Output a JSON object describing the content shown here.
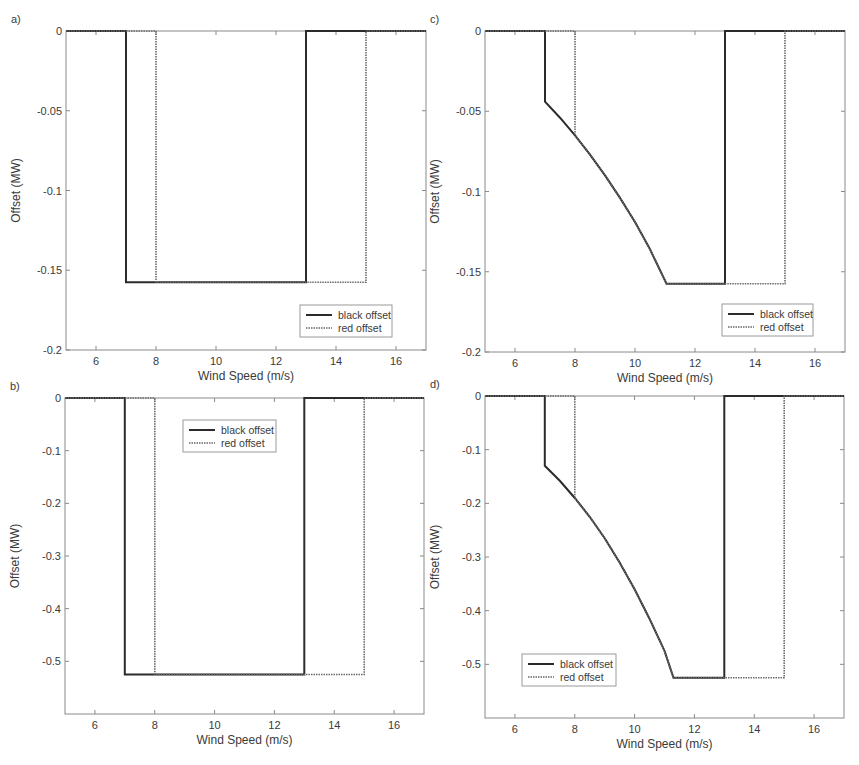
{
  "figure": {
    "colors": {
      "black_offset": "#2b2b2b",
      "red_offset": "#6a6a6a",
      "axis": "#8a8a8a",
      "legend_border": "#9a9a9a",
      "background": "#ffffff"
    }
  },
  "chart_data": [
    {
      "id": "a",
      "panel_label": "a)",
      "type": "line",
      "title": "",
      "xlabel": "Wind Speed (m/s)",
      "ylabel": "Offset (MW)",
      "xlim": [
        5,
        17
      ],
      "ylim": [
        -0.2,
        0
      ],
      "xticks": [
        6,
        8,
        10,
        12,
        14,
        16
      ],
      "yticks": [
        0,
        -0.05,
        -0.1,
        -0.15,
        -0.2
      ],
      "ytick_labels": [
        "0",
        "-0.05",
        "-0.1",
        "-0.15",
        "-0.2"
      ],
      "grid": false,
      "legend": {
        "position": "lower right",
        "entries": [
          "black offset",
          "red offset"
        ]
      },
      "box": {
        "left": 66,
        "top": 31,
        "right": 426,
        "bottom": 350
      },
      "legend_box": {
        "x": 300,
        "y": 305,
        "w": 92,
        "h": 32
      },
      "series": [
        {
          "name": "black offset",
          "style": "solid",
          "x": [
            5,
            7,
            7,
            13,
            13,
            17
          ],
          "y": [
            0,
            0,
            -0.1575,
            -0.1575,
            0,
            0
          ]
        },
        {
          "name": "red offset",
          "style": "dotted",
          "x": [
            5,
            8,
            8,
            15,
            15,
            17
          ],
          "y": [
            0,
            0,
            -0.1575,
            -0.1575,
            0,
            0
          ]
        }
      ]
    },
    {
      "id": "c",
      "panel_label": "c)",
      "type": "line",
      "title": "",
      "xlabel": "Wind Speed (m/s)",
      "ylabel": "Offset (MW)",
      "xlim": [
        5,
        17
      ],
      "ylim": [
        -0.2,
        0
      ],
      "xticks": [
        6,
        8,
        10,
        12,
        14,
        16
      ],
      "yticks": [
        0,
        -0.05,
        -0.1,
        -0.15,
        -0.2
      ],
      "ytick_labels": [
        "0",
        "-0.05",
        "-0.1",
        "-0.15",
        "-0.2"
      ],
      "grid": false,
      "legend": {
        "position": "lower right",
        "entries": [
          "black offset",
          "red offset"
        ]
      },
      "box": {
        "left": 485,
        "top": 31,
        "right": 845,
        "bottom": 352
      },
      "legend_box": {
        "x": 722,
        "y": 304,
        "w": 91,
        "h": 32
      },
      "series": [
        {
          "name": "black offset",
          "style": "solid",
          "x": [
            5,
            7,
            7,
            7.5,
            8,
            8.5,
            9,
            9.5,
            10,
            10.5,
            11.05,
            13,
            13,
            17
          ],
          "y": [
            0,
            0,
            -0.044,
            -0.054,
            -0.065,
            -0.077,
            -0.09,
            -0.104,
            -0.119,
            -0.136,
            -0.1575,
            -0.1575,
            0,
            0
          ]
        },
        {
          "name": "red offset",
          "style": "dotted",
          "x": [
            5,
            8,
            8,
            8.5,
            9,
            9.5,
            10,
            10.5,
            11.05,
            15,
            15,
            17
          ],
          "y": [
            0,
            0,
            -0.065,
            -0.077,
            -0.09,
            -0.104,
            -0.119,
            -0.136,
            -0.1575,
            -0.1575,
            0,
            0
          ]
        }
      ]
    },
    {
      "id": "b",
      "panel_label": "b)",
      "type": "line",
      "title": "",
      "xlabel": "Wind Speed (m/s)",
      "ylabel": "Offset (MW)",
      "xlim": [
        5,
        17
      ],
      "ylim": [
        -0.6,
        0
      ],
      "xticks": [
        6,
        8,
        10,
        12,
        14,
        16
      ],
      "yticks": [
        0,
        -0.1,
        -0.2,
        -0.3,
        -0.4,
        -0.5
      ],
      "ytick_labels": [
        "0",
        "-0.1",
        "-0.2",
        "-0.3",
        "-0.4",
        "-0.5"
      ],
      "grid": false,
      "legend": {
        "position": "upper center",
        "entries": [
          "black offset",
          "red offset"
        ]
      },
      "box": {
        "left": 65,
        "top": 398,
        "right": 424,
        "bottom": 714
      },
      "legend_box": {
        "x": 183,
        "y": 420,
        "w": 93,
        "h": 32
      },
      "series": [
        {
          "name": "black offset",
          "style": "solid",
          "x": [
            5,
            7,
            7,
            13,
            13,
            17
          ],
          "y": [
            0,
            0,
            -0.525,
            -0.525,
            0,
            0
          ]
        },
        {
          "name": "red offset",
          "style": "dotted",
          "x": [
            5,
            8,
            8,
            15,
            15,
            17
          ],
          "y": [
            0,
            0,
            -0.525,
            -0.525,
            0,
            0
          ]
        }
      ]
    },
    {
      "id": "d",
      "panel_label": "d)",
      "type": "line",
      "title": "",
      "xlabel": "Wind Speed (m/s)",
      "ylabel": "Offset (MW)",
      "xlim": [
        5,
        17
      ],
      "ylim": [
        -0.6,
        0
      ],
      "xticks": [
        6,
        8,
        10,
        12,
        14,
        16
      ],
      "yticks": [
        0,
        -0.1,
        -0.2,
        -0.3,
        -0.4,
        -0.5
      ],
      "ytick_labels": [
        "0",
        "-0.1",
        "-0.2",
        "-0.3",
        "-0.4",
        "-0.5"
      ],
      "grid": false,
      "legend": {
        "position": "lower left",
        "entries": [
          "black offset",
          "red offset"
        ]
      },
      "box": {
        "left": 485,
        "top": 396,
        "right": 844,
        "bottom": 718
      },
      "legend_box": {
        "x": 522,
        "y": 654,
        "w": 94,
        "h": 32
      },
      "series": [
        {
          "name": "black offset",
          "style": "solid",
          "x": [
            5,
            7,
            7,
            7.5,
            8,
            8.5,
            9,
            9.5,
            10,
            10.5,
            11,
            11.3,
            13,
            13,
            17
          ],
          "y": [
            0,
            0,
            -0.13,
            -0.158,
            -0.19,
            -0.225,
            -0.265,
            -0.31,
            -0.36,
            -0.415,
            -0.475,
            -0.525,
            -0.525,
            0,
            0
          ]
        },
        {
          "name": "red offset",
          "style": "dotted",
          "x": [
            5,
            8,
            8,
            8.5,
            9,
            9.5,
            10,
            10.5,
            11,
            11.3,
            15,
            15,
            17
          ],
          "y": [
            0,
            0,
            -0.19,
            -0.225,
            -0.265,
            -0.31,
            -0.36,
            -0.415,
            -0.475,
            -0.525,
            -0.525,
            0,
            0
          ]
        }
      ]
    }
  ]
}
